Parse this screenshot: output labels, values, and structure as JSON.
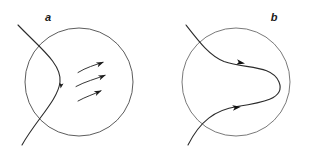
{
  "figure": {
    "background_color": "#ffffff",
    "stroke_color": "#3a3a3a",
    "curve_color": "#2b2b2b",
    "label_color": "#1a1a1a",
    "width": 309,
    "height": 161
  },
  "panels": [
    {
      "id": "a",
      "label": "a",
      "label_x": 48,
      "label_y": 21,
      "circle": {
        "cx": 79,
        "cy": 82,
        "r": 54
      },
      "description": "circle with a curve crossing through its left region and three short curved flow arrows inside",
      "main_curve": "M 18,25 C 40,48 62,64 60,82 C 58,100 36,120 22,145",
      "curve_arrow": {
        "x": 60.5,
        "y": 89,
        "angle": 100
      },
      "flow_arrows": [
        {
          "path": "M 78,72 C 86,67 96,65 104,62",
          "tip_x": 104,
          "tip_y": 62,
          "angle": -22
        },
        {
          "path": "M 76,86 C 85,81 96,79 106,75",
          "tip_x": 106,
          "tip_y": 75,
          "angle": -22
        },
        {
          "path": "M 78,101 C 86,96 95,94 102,90",
          "tip_x": 102,
          "tip_y": 90,
          "angle": -25
        }
      ]
    },
    {
      "id": "b",
      "label": "b",
      "label_x": 274,
      "label_y": 21,
      "circle": {
        "cx": 236,
        "cy": 82,
        "r": 54
      },
      "description": "circle with an S shaped curve folded into a horseshoe, two arrowheads pointing right",
      "main_curve": "M 186,25 C 203,45 212,57 226,62 C 248,68 272,66 280,82 C 288,98 262,104 236,106 C 214,108 200,120 188,145",
      "arrows": [
        {
          "x": 242,
          "y": 62.5,
          "angle": 6
        },
        {
          "x": 238,
          "y": 107,
          "angle": -6
        }
      ]
    }
  ]
}
